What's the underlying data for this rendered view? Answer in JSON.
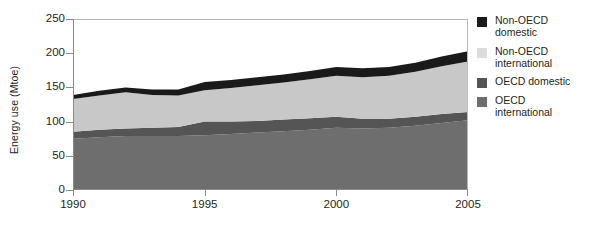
{
  "chart_data": {
    "type": "area",
    "title": "",
    "xlabel": "",
    "ylabel": "Energy use (Mtoe)",
    "stacked": true,
    "grid": false,
    "legend_position": "right",
    "xlim": [
      1990,
      2005
    ],
    "ylim": [
      0,
      250
    ],
    "yticks": [
      0,
      50,
      100,
      150,
      200,
      250
    ],
    "ytick_labels": [
      "0",
      "50",
      "100",
      "150",
      "200",
      "250"
    ],
    "xticks": [
      1990,
      1995,
      2000,
      2005
    ],
    "xtick_labels": [
      "1990",
      "1995",
      "2000",
      "2005"
    ],
    "x": [
      1990,
      1991,
      1992,
      1993,
      1994,
      1995,
      1996,
      1997,
      1998,
      1999,
      2000,
      2001,
      2002,
      2003,
      2004,
      2005
    ],
    "series": [
      {
        "name": "OECD international",
        "color": "#6e6e6e",
        "values": [
          75,
          77,
          79,
          79,
          79,
          80,
          82,
          84,
          86,
          88,
          91,
          90,
          91,
          94,
          98,
          102
        ]
      },
      {
        "name": "OECD domestic",
        "color": "#555555",
        "values": [
          10,
          11,
          11,
          12,
          13,
          20,
          18,
          17,
          17,
          17,
          16,
          14,
          13,
          13,
          13,
          12
        ]
      },
      {
        "name": "Non-OECD international",
        "color": "#c8c8c8",
        "values": [
          48,
          50,
          53,
          48,
          46,
          46,
          49,
          52,
          54,
          57,
          60,
          61,
          63,
          66,
          70,
          74
        ]
      },
      {
        "name": "Non-OECD domestic",
        "color": "#1a1a1a",
        "values": [
          6,
          7,
          7,
          8,
          9,
          12,
          12,
          12,
          12,
          12,
          13,
          13,
          13,
          13,
          14,
          15
        ]
      }
    ],
    "totals": [
      139,
      145,
      150,
      147,
      147,
      158,
      161,
      165,
      169,
      174,
      180,
      178,
      180,
      186,
      195,
      203
    ]
  },
  "legend": {
    "items": [
      {
        "label": "Non-OECD\ndomestic",
        "color": "#1a1a1a",
        "swatch_name": "legend-swatch-non-oecd-domestic"
      },
      {
        "label": "Non-OECD\ninternational",
        "color": "#dcdcdc",
        "swatch_name": "legend-swatch-non-oecd-international"
      },
      {
        "label": "OECD domestic",
        "color": "#555555",
        "swatch_name": "legend-swatch-oecd-domestic"
      },
      {
        "label": "OECD\ninternational",
        "color": "#6e6e6e",
        "swatch_name": "legend-swatch-oecd-international"
      }
    ]
  },
  "axes": {
    "y_title": "Energy use (Mtoe)",
    "y_labels": [
      "250",
      "200",
      "150",
      "100",
      "50",
      "0"
    ],
    "x_labels": [
      "1990",
      "1995",
      "2000",
      "2005"
    ]
  }
}
